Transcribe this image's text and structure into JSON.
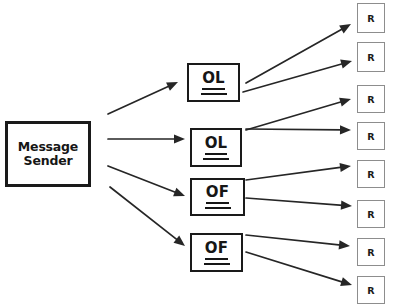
{
  "diagram": {
    "canvas": {
      "width": 406,
      "height": 306,
      "background": "#ffffff"
    },
    "colors": {
      "node_border": "#1a1a1a",
      "receiver_border": "#8d8d8d",
      "edge": "#262626",
      "text": "#161616",
      "background": "#ffffff"
    },
    "sender": {
      "id": "message-sender",
      "label_line1": "Message",
      "label_line2": "Sender",
      "x": 5,
      "y": 121,
      "width": 86,
      "height": 66
    },
    "middle_nodes": [
      {
        "id": "ol-1",
        "label": "OL",
        "x": 187,
        "y": 63,
        "width": 53,
        "height": 39
      },
      {
        "id": "ol-2",
        "label": "OL",
        "x": 190,
        "y": 128,
        "width": 52,
        "height": 39
      },
      {
        "id": "of-1",
        "label": "OF",
        "x": 190,
        "y": 178,
        "width": 55,
        "height": 38
      },
      {
        "id": "of-2",
        "label": "OF",
        "x": 190,
        "y": 233,
        "width": 53,
        "height": 39
      }
    ],
    "receivers": [
      {
        "id": "r-1",
        "label": "R",
        "x": 357,
        "y": 3,
        "width": 28,
        "height": 30
      },
      {
        "id": "r-2",
        "label": "R",
        "x": 357,
        "y": 42,
        "width": 28,
        "height": 30
      },
      {
        "id": "r-3",
        "label": "R",
        "x": 357,
        "y": 85,
        "width": 28,
        "height": 28
      },
      {
        "id": "r-4",
        "label": "R",
        "x": 357,
        "y": 122,
        "width": 28,
        "height": 28
      },
      {
        "id": "r-5",
        "label": "R",
        "x": 357,
        "y": 160,
        "width": 28,
        "height": 28
      },
      {
        "id": "r-6",
        "label": "R",
        "x": 357,
        "y": 200,
        "width": 28,
        "height": 28
      },
      {
        "id": "r-7",
        "label": "R",
        "x": 357,
        "y": 238,
        "width": 28,
        "height": 28
      },
      {
        "id": "r-8",
        "label": "R",
        "x": 357,
        "y": 276,
        "width": 28,
        "height": 28
      }
    ],
    "edges": [
      {
        "id": "edge-sender-ol1",
        "from": "message-sender",
        "to": "ol-1",
        "x1": 108,
        "y1": 114,
        "x2": 178,
        "y2": 82
      },
      {
        "id": "edge-sender-ol2",
        "from": "message-sender",
        "to": "ol-2",
        "x1": 108,
        "y1": 139,
        "x2": 185,
        "y2": 139
      },
      {
        "id": "edge-sender-of1",
        "from": "message-sender",
        "to": "of-1",
        "x1": 108,
        "y1": 166,
        "x2": 185,
        "y2": 196
      },
      {
        "id": "edge-sender-of2",
        "from": "message-sender",
        "to": "of-2",
        "x1": 110,
        "y1": 187,
        "x2": 185,
        "y2": 246
      },
      {
        "id": "edge-ol1-r1",
        "from": "ol-1",
        "to": "r-1",
        "x1": 246,
        "y1": 83,
        "x2": 351,
        "y2": 24
      },
      {
        "id": "edge-ol1-r2",
        "from": "ol-1",
        "to": "r-2",
        "x1": 243,
        "y1": 92,
        "x2": 352,
        "y2": 61
      },
      {
        "id": "edge-ol2-r3",
        "from": "ol-2",
        "to": "r-3",
        "x1": 246,
        "y1": 130,
        "x2": 351,
        "y2": 99
      },
      {
        "id": "edge-ol2-r4",
        "from": "ol-2",
        "to": "r-4",
        "x1": 246,
        "y1": 129,
        "x2": 351,
        "y2": 130
      },
      {
        "id": "edge-of1-r5",
        "from": "of-1",
        "to": "r-5",
        "x1": 246,
        "y1": 180,
        "x2": 351,
        "y2": 166
      },
      {
        "id": "edge-of1-r6",
        "from": "of-1",
        "to": "r-6",
        "x1": 246,
        "y1": 198,
        "x2": 352,
        "y2": 206
      },
      {
        "id": "edge-of2-r7",
        "from": "of-2",
        "to": "r-7",
        "x1": 246,
        "y1": 235,
        "x2": 350,
        "y2": 246
      },
      {
        "id": "edge-of2-r8",
        "from": "of-2",
        "to": "r-8",
        "x1": 246,
        "y1": 252,
        "x2": 352,
        "y2": 285
      }
    ]
  }
}
